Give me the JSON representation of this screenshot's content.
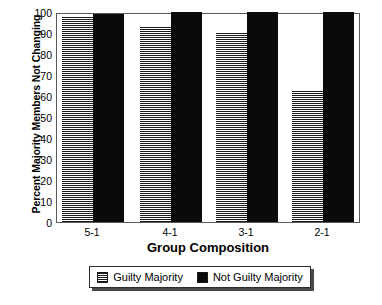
{
  "chart_data": {
    "type": "bar",
    "title": "",
    "xlabel": "Group Composition",
    "ylabel": "Percent Majority Members Not Changing",
    "categories": [
      "5-1",
      "4-1",
      "3-1",
      "2-1"
    ],
    "series": [
      {
        "name": "Guilty Majority",
        "values": [
          98,
          93,
          90,
          63
        ],
        "fill": "crosshatch",
        "color": "#1a1a1a"
      },
      {
        "name": "Not Guilty Majority",
        "values": [
          99,
          100,
          100,
          100
        ],
        "fill": "solid",
        "color": "#0a0a0a"
      }
    ],
    "ylim": [
      0,
      100
    ],
    "ytick_labels": [
      "100",
      "90",
      "80",
      "70",
      "60",
      "50",
      "40",
      "30",
      "20",
      "10",
      "0"
    ],
    "ytick_values": [
      100,
      90,
      80,
      70,
      60,
      50,
      40,
      30,
      20,
      10,
      0
    ],
    "grid": false,
    "legend_position": "bottom",
    "legend_entries": [
      "Guilty Majority",
      "Not Guilty Majority"
    ]
  }
}
